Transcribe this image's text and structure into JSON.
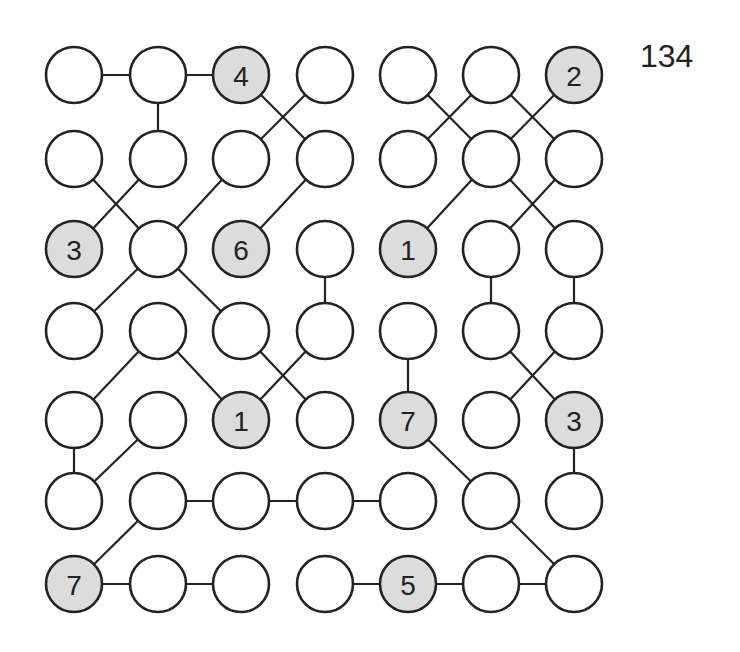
{
  "puzzle": {
    "number": "134",
    "type": "hashi-style numbered circle grid",
    "grid_size": {
      "rows": 7,
      "cols": 7
    },
    "colors": {
      "clue_fill": "#dcdcdc",
      "plain_fill": "#ffffff",
      "stroke": "#222222"
    },
    "col_x": [
      74,
      158,
      241,
      325,
      408,
      491,
      574
    ],
    "row_y": [
      75,
      159,
      249,
      331,
      420,
      501,
      584
    ],
    "radius": 28,
    "clues": [
      {
        "r": 0,
        "c": 2,
        "value": "4"
      },
      {
        "r": 0,
        "c": 6,
        "value": "2"
      },
      {
        "r": 2,
        "c": 0,
        "value": "3"
      },
      {
        "r": 2,
        "c": 2,
        "value": "6"
      },
      {
        "r": 2,
        "c": 4,
        "value": "1"
      },
      {
        "r": 4,
        "c": 2,
        "value": "1"
      },
      {
        "r": 4,
        "c": 4,
        "value": "7"
      },
      {
        "r": 4,
        "c": 6,
        "value": "3"
      },
      {
        "r": 6,
        "c": 0,
        "value": "7"
      },
      {
        "r": 6,
        "c": 4,
        "value": "5"
      }
    ],
    "edges": [
      [
        [
          0,
          0
        ],
        [
          0,
          1
        ]
      ],
      [
        [
          0,
          1
        ],
        [
          0,
          2
        ]
      ],
      [
        [
          0,
          1
        ],
        [
          1,
          1
        ]
      ],
      [
        [
          0,
          2
        ],
        [
          1,
          3
        ]
      ],
      [
        [
          0,
          3
        ],
        [
          1,
          2
        ]
      ],
      [
        [
          0,
          4
        ],
        [
          1,
          5
        ]
      ],
      [
        [
          0,
          5
        ],
        [
          1,
          4
        ]
      ],
      [
        [
          0,
          5
        ],
        [
          1,
          6
        ]
      ],
      [
        [
          0,
          6
        ],
        [
          1,
          5
        ]
      ],
      [
        [
          1,
          0
        ],
        [
          2,
          1
        ]
      ],
      [
        [
          1,
          1
        ],
        [
          2,
          0
        ]
      ],
      [
        [
          1,
          2
        ],
        [
          2,
          1
        ]
      ],
      [
        [
          1,
          3
        ],
        [
          2,
          2
        ]
      ],
      [
        [
          1,
          5
        ],
        [
          2,
          4
        ]
      ],
      [
        [
          1,
          5
        ],
        [
          2,
          6
        ]
      ],
      [
        [
          1,
          6
        ],
        [
          2,
          5
        ]
      ],
      [
        [
          2,
          1
        ],
        [
          3,
          0
        ]
      ],
      [
        [
          2,
          1
        ],
        [
          3,
          2
        ]
      ],
      [
        [
          2,
          3
        ],
        [
          3,
          3
        ]
      ],
      [
        [
          2,
          5
        ],
        [
          3,
          5
        ]
      ],
      [
        [
          2,
          6
        ],
        [
          3,
          6
        ]
      ],
      [
        [
          3,
          1
        ],
        [
          4,
          0
        ]
      ],
      [
        [
          3,
          1
        ],
        [
          4,
          2
        ]
      ],
      [
        [
          3,
          2
        ],
        [
          4,
          3
        ]
      ],
      [
        [
          3,
          3
        ],
        [
          4,
          2
        ]
      ],
      [
        [
          3,
          4
        ],
        [
          4,
          4
        ]
      ],
      [
        [
          3,
          5
        ],
        [
          4,
          6
        ]
      ],
      [
        [
          3,
          6
        ],
        [
          4,
          5
        ]
      ],
      [
        [
          4,
          0
        ],
        [
          5,
          0
        ]
      ],
      [
        [
          4,
          1
        ],
        [
          5,
          0
        ]
      ],
      [
        [
          4,
          4
        ],
        [
          5,
          5
        ]
      ],
      [
        [
          4,
          6
        ],
        [
          5,
          6
        ]
      ],
      [
        [
          5,
          1
        ],
        [
          5,
          2
        ]
      ],
      [
        [
          5,
          2
        ],
        [
          5,
          3
        ]
      ],
      [
        [
          5,
          3
        ],
        [
          5,
          4
        ]
      ],
      [
        [
          5,
          1
        ],
        [
          6,
          0
        ]
      ],
      [
        [
          5,
          5
        ],
        [
          6,
          6
        ]
      ],
      [
        [
          6,
          0
        ],
        [
          6,
          1
        ]
      ],
      [
        [
          6,
          1
        ],
        [
          6,
          2
        ]
      ],
      [
        [
          6,
          3
        ],
        [
          6,
          4
        ]
      ],
      [
        [
          6,
          4
        ],
        [
          6,
          5
        ]
      ],
      [
        [
          6,
          5
        ],
        [
          6,
          6
        ]
      ]
    ]
  }
}
